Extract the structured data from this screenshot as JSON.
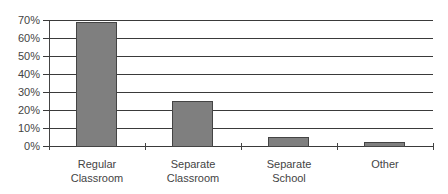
{
  "chart_data": {
    "type": "bar",
    "title": "",
    "xlabel": "",
    "ylabel": "",
    "categories": [
      "Regular Classroom",
      "Separate Classroom",
      "Separate School",
      "Other"
    ],
    "category_lines": [
      [
        "Regular",
        "Classroom"
      ],
      [
        "Separate",
        "Classroom"
      ],
      [
        "Separate",
        "School"
      ],
      [
        "Other",
        ""
      ]
    ],
    "values": [
      69,
      25,
      5,
      2
    ],
    "value_format": "percent",
    "ylim": [
      0,
      70
    ],
    "yticks": [
      "0%",
      "10%",
      "20%",
      "30%",
      "40%",
      "50%",
      "60%",
      "70%"
    ],
    "grid": true,
    "legend": null,
    "bar_color": "#7f7f7f"
  }
}
